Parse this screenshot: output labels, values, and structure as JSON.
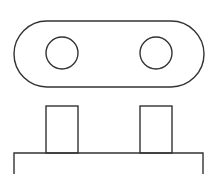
{
  "diagram": {
    "type": "line-drawing",
    "canvas": {
      "width": 220,
      "height": 174,
      "background": "#ffffff"
    },
    "stroke_color": "#333333",
    "shapes": {
      "plug_face": {
        "shape": "stadium",
        "x": 14,
        "y": 21,
        "width": 190,
        "height": 66,
        "radius": 33
      },
      "pin_hole_left": {
        "shape": "circle",
        "cx": 62,
        "cy": 53,
        "r": 16
      },
      "pin_hole_right": {
        "shape": "circle",
        "cx": 156,
        "cy": 53,
        "r": 16
      },
      "prong_left": {
        "shape": "rect",
        "x": 46,
        "y": 106,
        "width": 32,
        "height": 47
      },
      "prong_right": {
        "shape": "rect",
        "x": 140,
        "y": 106,
        "width": 32,
        "height": 47
      },
      "plug_body": {
        "shape": "rect-open-bottom",
        "x": 14,
        "y": 153,
        "width": 189,
        "height": 21
      }
    }
  }
}
